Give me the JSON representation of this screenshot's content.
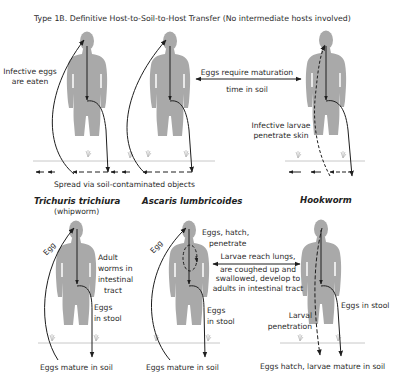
{
  "title": "Type 1B. Definitive Host-to-Soil-to-Host Transfer (No intermediate hosts involved)",
  "top_row": {
    "infective_eggs": [
      "Infective eggs",
      "are eaten"
    ],
    "maturation": [
      "Eggs require maturation",
      "time in soil"
    ],
    "larvae_skin": [
      "Infective larvae",
      "penetrate skin"
    ],
    "spread": "Spread via soil-contaminated objects"
  },
  "species": [
    {
      "name": "Trichuris trichiura",
      "common": "(whipworm)"
    },
    {
      "name": "Ascaris lumbricoides",
      "common": ""
    },
    {
      "name": "Hookworm",
      "common": ""
    }
  ],
  "bottom_row": {
    "trichuris": {
      "egg": "Egg",
      "adult": [
        "Adult",
        "worms in",
        "intestinal",
        "tract"
      ],
      "stool": [
        "Eggs",
        "in stool"
      ],
      "soil": "Eggs mature in soil"
    },
    "ascaris": {
      "egg": "Egg",
      "hatch": [
        "Eggs, hatch,",
        "penetrate"
      ],
      "lungs": [
        "Larvae reach lungs,",
        "are coughed up and",
        "swallowed, develop to",
        "adults in intestinal tract"
      ],
      "stool": [
        "Eggs",
        "in stool"
      ],
      "soil": "Eggs mature in soil"
    },
    "hookworm": {
      "stool": "Eggs in stool",
      "larval": [
        "Larval",
        "penetration"
      ],
      "soil": "Eggs hatch, larvae mature in soil"
    }
  },
  "colors": {
    "figure": "#a9a9a9",
    "line": "#1e1e1e",
    "ground": "#c8c8c8"
  }
}
